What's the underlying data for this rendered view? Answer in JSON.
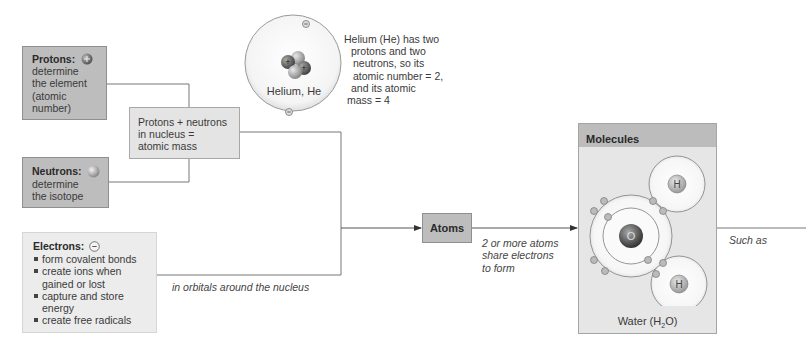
{
  "protons": {
    "title": "Protons:",
    "icon": "plus-sphere-icon",
    "lines": [
      "determine",
      "the element",
      "(atomic",
      "number)"
    ]
  },
  "neutrons": {
    "title": "Neutrons:",
    "icon": "neutral-sphere-icon",
    "lines": [
      "determine",
      "the isotope"
    ]
  },
  "nucleus_box": {
    "lines": [
      "Protons + neutrons",
      "in nucleus =",
      "atomic mass"
    ]
  },
  "electrons": {
    "title": "Electrons:",
    "icon": "minus-circle-icon",
    "bullets": [
      [
        "form covalent bonds"
      ],
      [
        "create ions when",
        "gained or lost"
      ],
      [
        "capture and store",
        "energy"
      ],
      [
        "create free radicals"
      ]
    ],
    "connector_label": "in orbitals around the nucleus"
  },
  "helium": {
    "label": "Helium, He",
    "description": [
      "Helium (He) has two",
      "protons and two",
      "neutrons, so its",
      "atomic number = 2,",
      "and its atomic",
      "mass = 4"
    ]
  },
  "atoms": {
    "label": "Atoms",
    "connector_label": [
      "2 or more atoms",
      "share electrons",
      "to form"
    ]
  },
  "molecules": {
    "title": "Molecules",
    "oxygen_label": "O",
    "hydrogen_label": "H",
    "caption_prefix": "Water (H",
    "caption_sub": "2",
    "caption_suffix": "O)",
    "connector_label": "Such as"
  },
  "colors": {
    "dark_box": "#bdbdbd",
    "light_box": "#e4e4e4",
    "line": "#6e6e6e"
  }
}
